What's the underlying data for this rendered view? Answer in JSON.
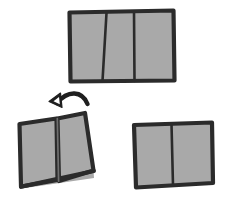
{
  "figure": {
    "type": "hand-drawn instructional diagram",
    "background_color": "#ffffff",
    "panel_fill_color": "#a9a9a9",
    "outline_color": "#2b2b2b",
    "crease_color": "#2b2b2b",
    "arrow_color": "#1f1f1f",
    "canvas": {
      "width": 230,
      "height": 213
    }
  },
  "steps": [
    {
      "id": "step-unfolded",
      "label": "Unfolded trifold sheet",
      "position": "top-center",
      "panel_count": 3,
      "crease_count": 2,
      "state": "flat",
      "bbox": {
        "x": 67,
        "y": 9,
        "width": 108,
        "height": 74
      }
    },
    {
      "id": "step-folding",
      "label": "Folding in progress",
      "position": "bottom-left",
      "panel_count": 2,
      "crease_count": 1,
      "state": "partially-folded",
      "bbox": {
        "x": 16,
        "y": 108,
        "width": 80,
        "height": 82
      }
    },
    {
      "id": "step-folded",
      "label": "Folded result",
      "position": "bottom-right",
      "panel_count": 2,
      "crease_count": 1,
      "state": "folded",
      "bbox": {
        "x": 132,
        "y": 122,
        "width": 82,
        "height": 66
      }
    }
  ],
  "arrow": {
    "id": "fold-direction-arrow",
    "label": "Fold direction",
    "direction": "up-left",
    "style": "curved-solid",
    "head": "triangular-outlined"
  },
  "shapes": {
    "unfolded": {
      "outline": "M 69.5 12.5 L 173.5 10.5 L 174.5 80.5 L 70.5 81.5 Z",
      "fill": "M 69.5 12.5 L 173.5 10.5 L 174.5 80.5 L 70.5 81.5 Z",
      "creases": [
        "M 106.5 13.0 L 102.5 80.8",
        "M 134.0 11.6 L 134.5 81.0"
      ]
    },
    "folding": {
      "left_panel_fill": "M 19.5 124.0 L 56.5 118.5 L 57.5 180.0 L 21.0 186.5 Z",
      "left_panel_outline": "M 19.5 124.0 L 56.5 118.5 L 57.5 180.0 L 21.0 186.5 Z",
      "right_panel_fill": "M 57.5 118.5 L 85.0 113.0 L 93.5 170.5 L 59.0 181.0 Z",
      "right_panel_outline": "M 57.5 118.5 L 85.0 113.0 L 93.5 170.5 L 59.0 181.0 Z",
      "base_fill": "M 21.0 186.5 L 93.5 170.5 L 94.0 178.0 L 22.0 188.5 Z",
      "base_outline": "M 21.0 186.5 L 93.5 170.5",
      "spine": "M 57.3 118.6 L 58.6 181.2",
      "bottom_edge": "M 21.0 186.8 L 93.8 171.0"
    },
    "folded": {
      "outline": "M 134.0 125.0 L 212.0 122.5 L 213.0 183.0 L 136.0 187.5 Z",
      "fill": "M 134.0 125.0 L 212.0 122.5 L 213.0 183.0 L 136.0 187.5 Z",
      "creases": [
        "M 171.5 124.0 L 173.0 185.5"
      ]
    },
    "arrow": {
      "curve": "M 57.0 103.0 C 68.0 90.0 82.0 90.5 87.5 104.0",
      "head": "M 60.5 93.0 L 49.0 101.5 L 62.0 107.5 Z",
      "head_inner": "M 59.0 97.0 L 53.5 101.3 L 59.8 104.2 Z"
    }
  }
}
